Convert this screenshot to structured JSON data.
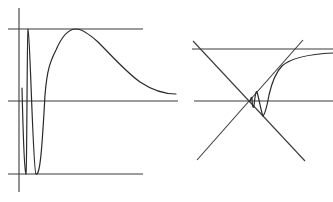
{
  "figure": {
    "panels": [
      {
        "id": "left",
        "description": "Damped oscillation: rapid oscillations between upper and lower bounds, then a single hump decaying toward the middle line",
        "axis": {
          "x": 19,
          "y1": 8,
          "y2": 192
        },
        "bounds": [
          {
            "name": "upper-bound",
            "y": 29,
            "x1": 8,
            "x2": 143
          },
          {
            "name": "middle-line",
            "y": 101,
            "x1": 8,
            "x2": 178
          },
          {
            "name": "lower-bound",
            "y": 174,
            "x1": 8,
            "x2": 143
          }
        ],
        "curve_path": "M22,88 C23,130 24,172 26,174 C27,172 27,30 28,29 C30,30 33,172 36,174 C40,176 42,150 45,95 C47,70 50,62 56,50 C62,36 68,29 76,29 C82,29 88,33 98,42 C112,56 126,72 140,82 C152,90 164,94 176,94"
      },
      {
        "id": "right",
        "description": "Crossing diagonals with two horizontal lines; a curve spirals into the intersection point",
        "lines": [
          {
            "name": "upper-horizontal",
            "x1": 192,
            "y1": 49,
            "x2": 333,
            "y2": 49
          },
          {
            "name": "middle-horizontal",
            "x1": 194,
            "y1": 101,
            "x2": 333,
            "y2": 101
          },
          {
            "name": "diagonal-descending",
            "x1": 193,
            "y1": 41,
            "x2": 305,
            "y2": 161
          },
          {
            "name": "diagonal-ascending",
            "x1": 197,
            "y1": 160,
            "x2": 303,
            "y2": 40
          }
        ],
        "curve_path": "M333,53 C310,54 292,57 282,66 C276,72 272,82 269,95 C267,106 265,114 263,116 C261,112 259,98 257,92 C256,90 255,96 254,106 C253,110 252,104 252,98 C251,96 251,100 250,101"
      }
    ]
  }
}
